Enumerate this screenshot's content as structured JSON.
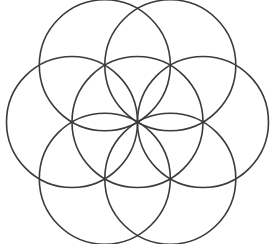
{
  "figure": {
    "type": "geometric-line-drawing",
    "canvas": {
      "width": 275,
      "height": 244
    },
    "background_color": "#ffffff",
    "stroke_color": "#3c3a3a",
    "stroke_width": 1.6,
    "center": {
      "x": 137.5,
      "y": 122.0
    },
    "radius": 65.5,
    "circle_count": 7,
    "circles": [
      {
        "name": "center-circle",
        "cx": 137.5,
        "cy": 122.0,
        "r": 65.5,
        "angle_deg": null
      },
      {
        "name": "east-circle",
        "cx": 203.0,
        "cy": 122.0,
        "r": 65.5,
        "angle_deg": 0
      },
      {
        "name": "north-east-circle",
        "cx": 170.3,
        "cy": 65.3,
        "r": 65.5,
        "angle_deg": 60
      },
      {
        "name": "north-west-circle",
        "cx": 104.8,
        "cy": 65.3,
        "r": 65.5,
        "angle_deg": 120
      },
      {
        "name": "west-circle",
        "cx": 72.0,
        "cy": 122.0,
        "r": 65.5,
        "angle_deg": 180
      },
      {
        "name": "south-west-circle",
        "cx": 104.8,
        "cy": 178.7,
        "r": 65.5,
        "angle_deg": 240
      },
      {
        "name": "south-east-circle",
        "cx": 170.3,
        "cy": 178.7,
        "r": 65.5,
        "angle_deg": 300
      }
    ],
    "extents": {
      "left_x": 6.5,
      "right_x": 268.5,
      "top_y": 0.5,
      "bottom_y": 243.5
    }
  }
}
